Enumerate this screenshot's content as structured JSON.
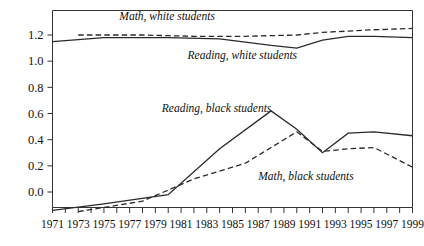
{
  "chart_data": {
    "type": "line",
    "title": "",
    "subtitle": "",
    "xlabel": "",
    "ylabel": "",
    "xlim": [
      1971,
      1999
    ],
    "ylim": [
      -0.18,
      1.3
    ],
    "yticks": [
      "0.0",
      "0.2",
      "0.4",
      "0.6",
      "0.8",
      "1.0",
      "1.2"
    ],
    "ytick_values": [
      0.0,
      0.2,
      0.4,
      0.6,
      0.8,
      1.0,
      1.2
    ],
    "xticks_labeled": [
      "1971",
      "1973",
      "1975",
      "1977",
      "1979",
      "1981",
      "1983",
      "1985",
      "1987",
      "1989",
      "1991",
      "1993",
      "1995",
      "1997",
      "1999"
    ],
    "xtick_all_years": [
      1971,
      1972,
      1973,
      1974,
      1975,
      1976,
      1977,
      1978,
      1979,
      1980,
      1981,
      1982,
      1983,
      1984,
      1985,
      1986,
      1987,
      1988,
      1989,
      1990,
      1991,
      1992,
      1993,
      1994,
      1995,
      1996,
      1997,
      1998,
      1999
    ],
    "grid": false,
    "legend_position": "inline-annotations",
    "series": [
      {
        "name": "Math, white students",
        "style": "dashed",
        "color": "#2a2a2a",
        "x": [
          1973,
          1978,
          1982,
          1986,
          1990,
          1992,
          1994,
          1996,
          1999
        ],
        "values": [
          1.2,
          1.2,
          1.19,
          1.19,
          1.2,
          1.22,
          1.23,
          1.24,
          1.25
        ]
      },
      {
        "name": "Reading, white students",
        "style": "solid",
        "color": "#2a2a2a",
        "x": [
          1971,
          1975,
          1980,
          1984,
          1988,
          1990,
          1992,
          1994,
          1996,
          1999
        ],
        "values": [
          1.15,
          1.18,
          1.18,
          1.17,
          1.12,
          1.1,
          1.16,
          1.19,
          1.19,
          1.18
        ]
      },
      {
        "name": "Reading, black students",
        "style": "solid",
        "color": "#2a2a2a",
        "x": [
          1971,
          1975,
          1980,
          1984,
          1988,
          1990,
          1992,
          1994,
          1996,
          1999
        ],
        "values": [
          -0.14,
          -0.09,
          -0.02,
          0.33,
          0.62,
          0.48,
          0.3,
          0.45,
          0.46,
          0.43
        ]
      },
      {
        "name": "Math, black students",
        "style": "dashed",
        "color": "#2a2a2a",
        "x": [
          1973,
          1978,
          1982,
          1986,
          1990,
          1992,
          1994,
          1996,
          1999
        ],
        "values": [
          -0.15,
          -0.07,
          0.1,
          0.22,
          0.46,
          0.31,
          0.33,
          0.34,
          0.19
        ]
      }
    ],
    "annotations": [
      {
        "name": "math-white-students-label",
        "text": "Math, white students",
        "x": 1976.2,
        "y_px": 20
      },
      {
        "name": "reading-white-students-label",
        "text": "Reading, white students",
        "x": 1981.5,
        "y_px": 59
      },
      {
        "name": "reading-black-students-label",
        "text": "Reading, black students",
        "x": 1979.5,
        "y_px": 112
      },
      {
        "name": "math-black-students-label",
        "text": "Math, black students",
        "x": 1987.0,
        "y_px": 180
      }
    ]
  },
  "colors": {
    "line": "#2a2a2a",
    "axis": "#333333",
    "text": "#111111",
    "background": "#ffffff"
  }
}
